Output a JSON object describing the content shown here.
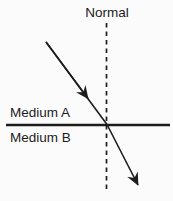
{
  "diagram": {
    "type": "refraction-ray-diagram",
    "labels": {
      "normal": "Normal",
      "medium_a": "Medium A",
      "medium_b": "Medium B"
    },
    "colors": {
      "ink": "#1c1c1c",
      "background": "#fbfbfb"
    }
  }
}
